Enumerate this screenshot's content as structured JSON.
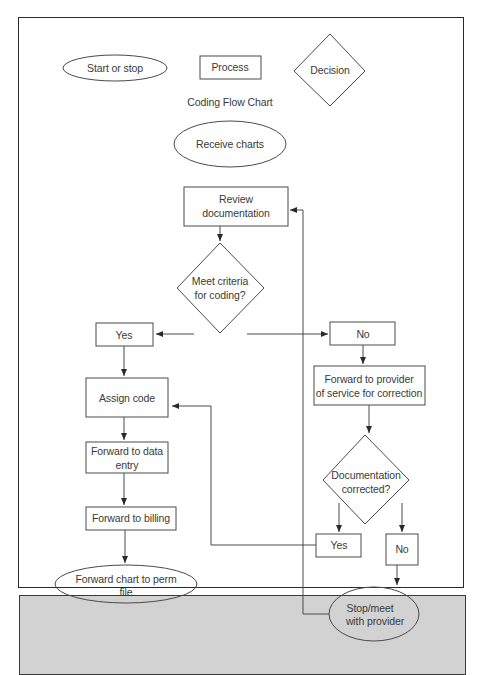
{
  "legend": {
    "terminal": "Start or stop",
    "process": "Process",
    "decision": "Decision"
  },
  "title": "Coding Flow Chart",
  "nodes": {
    "receive": "Receive charts",
    "review_l1": "Review",
    "review_l2": "documentation",
    "criteria_l1": "Meet criteria",
    "criteria_l2": "for coding?",
    "yes1": "Yes",
    "no1": "No",
    "provider_l1": "Forward to provider",
    "provider_l2": "of service for correction",
    "assign": "Assign code",
    "data_entry_l1": "Forward to data",
    "data_entry_l2": "entry",
    "billing": "Forward to billing",
    "perm_l1": "Forward chart to perm",
    "perm_l2": "file",
    "corrected_l1": "Documentation",
    "corrected_l2": "corrected?",
    "yes2": "Yes",
    "no2": "No",
    "stop_l1": "Stop/meet",
    "stop_l2": "with provider"
  },
  "colors": {
    "stroke": "#3a3a3a",
    "strip": "#d2d2d2"
  }
}
